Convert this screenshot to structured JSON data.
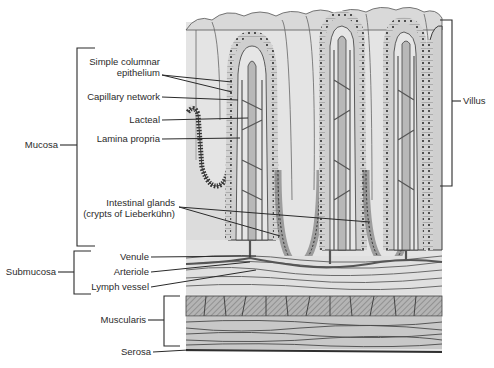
{
  "diagram": {
    "colors": {
      "tissue_light": "#e3e3e3",
      "tissue_mid": "#c8c8c8",
      "tissue_dark": "#a9a9a9",
      "outline": "#3a3a3a",
      "background": "#ffffff"
    },
    "left_labels": [
      {
        "id": "simple-columnar-epithelium",
        "line1": "Simple columnar",
        "line2": "epithelium"
      },
      {
        "id": "capillary-network",
        "text": "Capillary network"
      },
      {
        "id": "lacteal",
        "text": "Lacteal"
      },
      {
        "id": "lamina-propria",
        "text": "Lamina propria"
      },
      {
        "id": "intestinal-glands",
        "line1": "Intestinal glands",
        "line2": "(crypts of Lieberkühn)"
      },
      {
        "id": "venule",
        "text": "Venule"
      },
      {
        "id": "arteriole",
        "text": "Arteriole"
      },
      {
        "id": "lymph-vessel",
        "text": "Lymph vessel"
      },
      {
        "id": "serosa",
        "text": "Serosa"
      }
    ],
    "brackets": [
      {
        "id": "mucosa",
        "text": "Mucosa"
      },
      {
        "id": "submucosa",
        "text": "Submucosa"
      },
      {
        "id": "muscularis",
        "text": "Muscularis"
      },
      {
        "id": "villus",
        "text": "Villus"
      }
    ]
  }
}
